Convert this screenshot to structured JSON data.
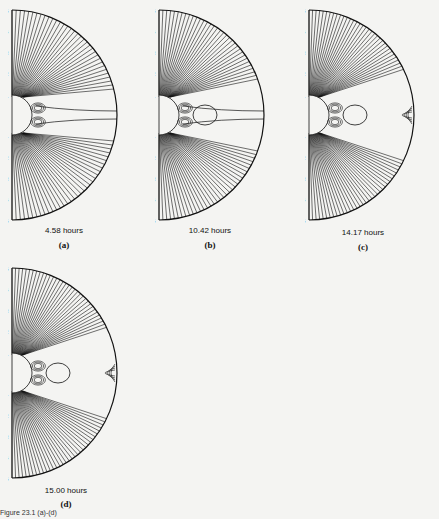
{
  "figure": {
    "panels": [
      {
        "id": "a",
        "time": "4.58 hours",
        "letter": "(a)",
        "label": "O₁",
        "features": "two X-points near equator"
      },
      {
        "id": "b",
        "time": "10.42 hours",
        "letter": "(b)",
        "label_top": "O₂",
        "label_bottom": "O₃",
        "features": "closed loop with dotted separatrix"
      },
      {
        "id": "c",
        "time": "14.17 hours",
        "letter": "(c)",
        "label": "O₄",
        "features": "plasmoid loop, disconnected nested arcs at outer edge"
      },
      {
        "id": "d",
        "time": "15.00 hours",
        "letter": "(d)",
        "features": "closed loop, nested arcs at outer edge"
      }
    ],
    "axis_ticks": [
      "5",
      "4",
      "3",
      "2",
      "1",
      "1",
      "2",
      "3",
      "4",
      "5"
    ],
    "caption": "Figure 23.1 (a)-(d)"
  }
}
